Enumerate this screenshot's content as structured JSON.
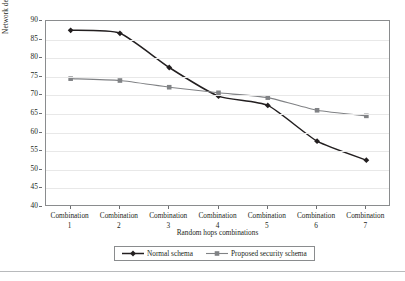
{
  "chart_data": {
    "type": "line",
    "title": "",
    "xlabel": "Random hops combinations",
    "ylabel": "Network delivery ratio%",
    "categories": [
      "Combination 1",
      "Combination 2",
      "Combination 3",
      "Combination 4",
      "Combination 5",
      "Combination 6",
      "Combination 7"
    ],
    "category_lines": [
      [
        "Combination",
        "1"
      ],
      [
        "Combination",
        "2"
      ],
      [
        "Combination",
        "3"
      ],
      [
        "Combination",
        "4"
      ],
      [
        "Combination",
        "5"
      ],
      [
        "Combination",
        "6"
      ],
      [
        "Combination",
        "7"
      ]
    ],
    "ylim": [
      40,
      90
    ],
    "ytick_labels": [
      "90",
      "85",
      "80",
      "75",
      "70",
      "65",
      "60",
      "55",
      "50",
      "45",
      "40"
    ],
    "ytick_values": [
      90,
      85,
      80,
      75,
      70,
      65,
      60,
      55,
      50,
      45,
      40
    ],
    "grid": true,
    "legend_position": "bottom-center",
    "series": [
      {
        "name": "Normal schema",
        "marker": "diamond",
        "color": "#231f20",
        "values": [
          87.5,
          86.7,
          77.5,
          69.8,
          67.3,
          57.7,
          52.6
        ]
      },
      {
        "name": "Proposed security schema",
        "marker": "square",
        "color": "#808285",
        "values": [
          74.5,
          74.0,
          72.2,
          70.7,
          69.4,
          66.0,
          64.5
        ]
      }
    ]
  },
  "legend": {
    "entries": [
      {
        "label": "Normal schema"
      },
      {
        "label": "Proposed security schema"
      }
    ]
  },
  "colors": {
    "normal_schema": "#231f20",
    "proposed_schema": "#808285",
    "grid": "#e8e8e8",
    "axis": "#8a8c8e",
    "text": "#231f20"
  }
}
